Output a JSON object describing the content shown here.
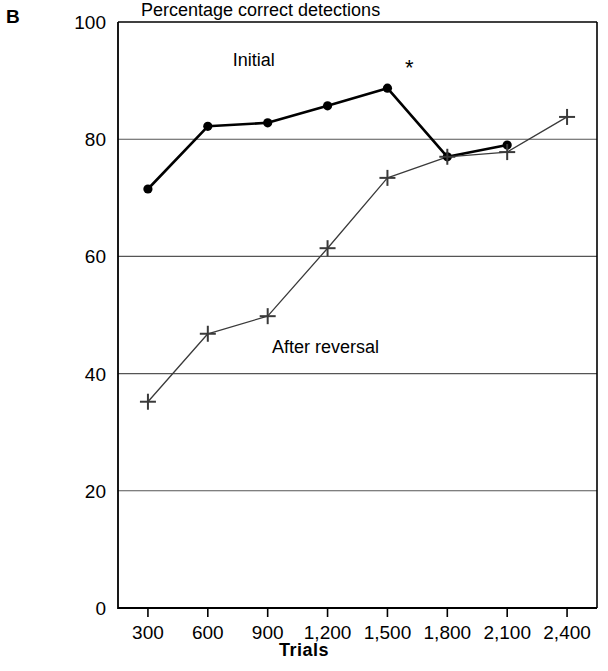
{
  "figure": {
    "panel_label": "B",
    "title": "Percentage correct detections",
    "x_axis_title": "Trials"
  },
  "chart_data": {
    "type": "line",
    "title": "Percentage correct detections",
    "xlabel": "Trials",
    "ylabel": "",
    "x": [
      300,
      600,
      900,
      1200,
      1500,
      1800,
      2100,
      2400
    ],
    "x_tick_labels": [
      "300",
      "600",
      "900",
      "1,200",
      "1,500",
      "1,800",
      "2,100",
      "2,400"
    ],
    "y_ticks": [
      0,
      20,
      40,
      60,
      80,
      100
    ],
    "y_tick_labels": [
      "0",
      "20",
      "40",
      "60",
      "80",
      "100"
    ],
    "xlim": [
      150,
      2550
    ],
    "ylim": [
      0,
      100
    ],
    "grid": "horizontal",
    "legend": "inline-annotations",
    "series": [
      {
        "name": "Initial",
        "marker": "filled-circle",
        "color": "#000000",
        "x": [
          300,
          600,
          900,
          1200,
          1500,
          1800,
          2100
        ],
        "values": [
          71.5,
          82.2,
          82.8,
          85.7,
          88.7,
          77.0,
          79.0
        ]
      },
      {
        "name": "After reversal",
        "marker": "plus",
        "color": "#3a3a3a",
        "x": [
          300,
          600,
          900,
          1200,
          1500,
          1800,
          2100,
          2400
        ],
        "values": [
          35.2,
          46.8,
          49.8,
          61.4,
          73.4,
          77.0,
          77.8,
          83.8
        ]
      }
    ],
    "annotations": [
      {
        "text": "Initial",
        "x": 830,
        "y": 92.5
      },
      {
        "text": "After reversal",
        "x": 1190,
        "y": 43.5
      },
      {
        "text": "*",
        "x": 1610,
        "y": 91.0
      }
    ]
  }
}
